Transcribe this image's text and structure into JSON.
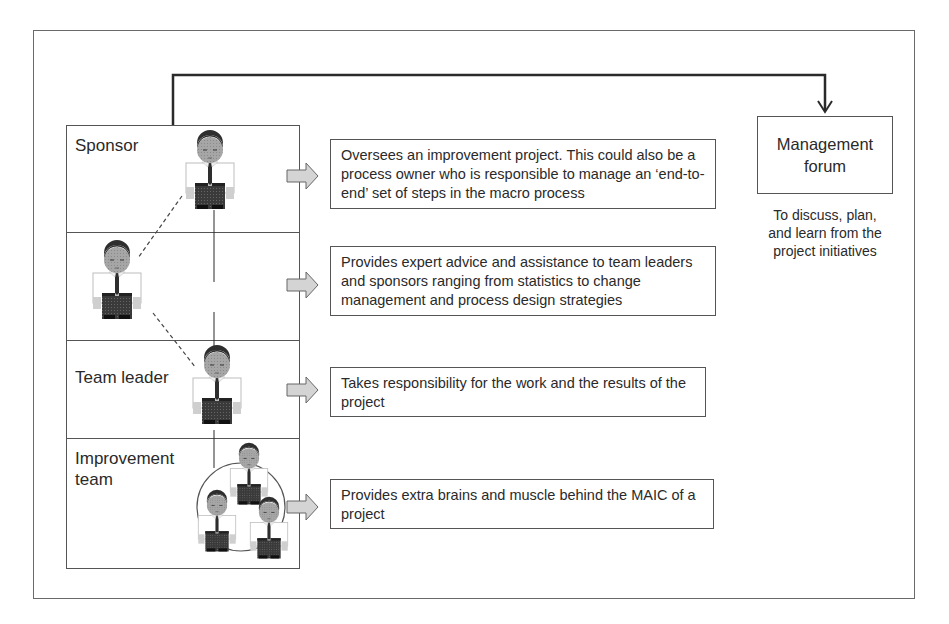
{
  "diagram": {
    "roles": [
      {
        "id": "sponsor",
        "label": "Sponsor",
        "description": "Oversees an improvement project.  This could also be a process owner who is responsible to manage an ‘end-to-end’ set of steps in the macro process"
      },
      {
        "id": "coach",
        "label": "Coach",
        "description": "Provides expert advice and assistance to team leaders and sponsors ranging from statistics to change management and process design strategies"
      },
      {
        "id": "team-leader",
        "label": "Team leader",
        "description": "Takes responsibility for the work and the results of the project"
      },
      {
        "id": "improvement-team",
        "label": "Improvement team",
        "label_line1": "Improvement",
        "label_line2": "team",
        "description": "Provides extra brains and muscle behind the MAIC of a project"
      }
    ],
    "management_forum": {
      "title_line1": "Management",
      "title_line2": "forum",
      "note_line1": "To discuss, plan,",
      "note_line2": "and learn from the",
      "note_line3": "project initiatives"
    },
    "colors": {
      "line": "#2a2a2a",
      "border": "#555555",
      "arrow_fill": "#d4d4d4",
      "shirt": "#ffffff",
      "face": "#a9a9a9",
      "hair": "#2e2e2e",
      "pants": "#3a3a3a"
    }
  }
}
